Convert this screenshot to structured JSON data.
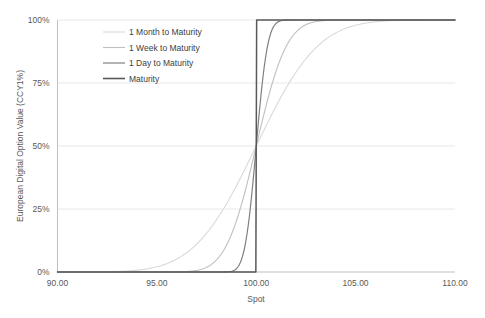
{
  "chart_data": {
    "type": "line",
    "title": "",
    "xlabel": "Spot",
    "ylabel": "European Digital Option Value (CCY1%)",
    "xlim": [
      90,
      110
    ],
    "ylim": [
      0,
      1
    ],
    "xticks": [
      "90.00",
      "95.00",
      "100.00",
      "105.00",
      "110.00"
    ],
    "xtick_values": [
      90,
      95,
      100,
      105,
      110
    ],
    "yticks": [
      "0%",
      "25%",
      "50%",
      "75%",
      "100%"
    ],
    "ytick_values": [
      0,
      0.25,
      0.5,
      0.75,
      1
    ],
    "grid": "horizontal",
    "legend_position": "upper-center-left",
    "strike": 100,
    "series": [
      {
        "name": "1 Month to Maturity",
        "color": "#D9D9D9",
        "width": 1.1,
        "sigma": 2.45,
        "x": [
          90,
          91,
          92,
          93,
          94,
          95,
          96,
          97,
          98,
          99,
          100,
          101,
          102,
          103,
          104,
          105,
          106,
          107,
          108,
          109,
          110
        ],
        "values": [
          0.0,
          0.001,
          0.003,
          0.009,
          0.026,
          0.062,
          0.125,
          0.22,
          0.34,
          0.42,
          0.5,
          0.625,
          0.73,
          0.815,
          0.88,
          0.925,
          0.955,
          0.974,
          0.986,
          0.993,
          0.997
        ]
      },
      {
        "name": "1 Week to Maturity",
        "color": "#BFBFBF",
        "width": 1.1,
        "sigma": 1.2,
        "x": [
          90,
          91,
          92,
          93,
          94,
          95,
          96,
          97,
          98,
          99,
          100,
          101,
          102,
          103,
          104,
          105,
          106,
          107,
          108,
          109,
          110
        ],
        "values": [
          0.0,
          0.0,
          0.0,
          0.0,
          0.0,
          0.002,
          0.008,
          0.035,
          0.12,
          0.3,
          0.5,
          0.76,
          0.9,
          0.962,
          0.987,
          0.996,
          0.999,
          1.0,
          1.0,
          1.0,
          1.0
        ]
      },
      {
        "name": "1 Day to Maturity",
        "color": "#808080",
        "width": 1.2,
        "sigma": 0.45,
        "x": [
          90,
          91,
          92,
          93,
          94,
          95,
          96,
          97,
          98,
          99,
          100,
          101,
          102,
          103,
          104,
          105,
          106,
          107,
          108,
          109,
          110
        ],
        "values": [
          0.0,
          0.0,
          0.0,
          0.0,
          0.0,
          0.0,
          0.0,
          0.0,
          0.002,
          0.13,
          0.5,
          0.92,
          0.995,
          1.0,
          1.0,
          1.0,
          1.0,
          1.0,
          1.0,
          1.0,
          1.0
        ]
      },
      {
        "name": "Maturity",
        "color": "#595959",
        "width": 1.5,
        "step": true,
        "x": [
          90,
          99.98,
          100,
          100.02,
          110
        ],
        "values": [
          0.0,
          0.0,
          0.5,
          1.0,
          1.0
        ]
      }
    ]
  },
  "axes": {
    "x_title": "Spot",
    "y_title": "European Digital Option Value (CCY1%)"
  },
  "legend": {
    "items": [
      {
        "label": "1 Month to Maturity",
        "color": "#D9D9D9"
      },
      {
        "label": "1 Week to Maturity",
        "color": "#BFBFBF"
      },
      {
        "label": "1 Day to Maturity",
        "color": "#808080"
      },
      {
        "label": "Maturity",
        "color": "#595959"
      }
    ]
  },
  "colors": {
    "axis": "#A6A6A6",
    "grid": "#E8E8E8",
    "text": "#595959",
    "background": "#FFFFFF"
  }
}
